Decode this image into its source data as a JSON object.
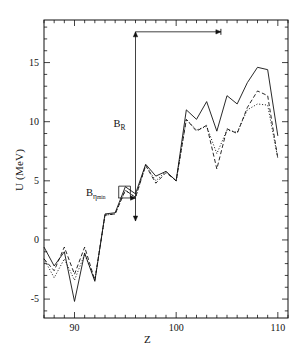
{
  "figure": {
    "kind": "scientific-line-plot",
    "background": "#ffffff",
    "frame_color": "#000000"
  },
  "axes": {
    "xlabel": "Z",
    "ylabel": "U (MeV)",
    "x_tick_labels": [
      "90",
      "100",
      "110"
    ],
    "x_tick_values": [
      90,
      100,
      110
    ],
    "y_tick_labels": [
      "-5",
      "0",
      "5",
      "10",
      "15"
    ],
    "y_tick_values": [
      -5,
      0,
      5,
      10,
      15
    ],
    "xlim": [
      87,
      111
    ],
    "ylim": [
      -6.6,
      18.6
    ],
    "x_minor_step": 1,
    "y_minor_step": 1,
    "grid": false
  },
  "annotations": [
    {
      "name": "b-r-label",
      "text_main": "B",
      "text_sub": "R",
      "x": 96.0,
      "y": 9.7
    },
    {
      "name": "b-eta-label",
      "text_main": "B",
      "text_sub": "η",
      "text_subsub": "min",
      "x": 93.3,
      "y": 3.9
    },
    {
      "name": "vertical-arrow-b-r",
      "type": "double-arrow-vertical",
      "x": 96.0,
      "y_start": 1.6,
      "y_end": 17.6
    },
    {
      "name": "horizontal-arrow-top",
      "type": "arrow-horizontal",
      "y": 17.6,
      "x_start": 96.0,
      "x_end": 104.4
    },
    {
      "name": "horizontal-arrow-b-eta",
      "type": "double-arrow-horizontal",
      "y": 3.55,
      "x_start": 94.3,
      "x_end": 96.0
    },
    {
      "name": "bracket-b-eta",
      "type": "vertical-bracket",
      "x_start": 94.35,
      "x_end": 95.5,
      "y_top": 4.55,
      "y_bottom": 3.55
    }
  ],
  "chart_data": {
    "type": "line",
    "title": "",
    "xlabel": "Z",
    "ylabel": "U (MeV)",
    "xlim": [
      87,
      111
    ],
    "ylim": [
      -6.6,
      18.6
    ],
    "grid": false,
    "legend": "none",
    "x": [
      87,
      88,
      89,
      90,
      91,
      92,
      93,
      94,
      95,
      96,
      97,
      98,
      99,
      100,
      101,
      102,
      103,
      104,
      105,
      106,
      107,
      108,
      109,
      110
    ],
    "series": [
      {
        "name": "solid-curve",
        "style": "solid",
        "color": "#111111",
        "values": [
          -0.6,
          -2.2,
          -1.0,
          -5.2,
          -1.1,
          -3.5,
          2.2,
          2.3,
          4.5,
          3.9,
          6.4,
          5.4,
          5.8,
          5.0,
          11.0,
          10.2,
          11.7,
          9.2,
          12.2,
          11.5,
          13.3,
          14.6,
          14.4,
          8.8
        ]
      },
      {
        "name": "dashed-curve",
        "style": "dashed",
        "color": "#111111",
        "values": [
          -1.6,
          -2.6,
          -0.6,
          -2.9,
          -0.6,
          -3.4,
          2.1,
          2.2,
          4.2,
          3.6,
          6.3,
          4.8,
          5.7,
          5.0,
          10.2,
          9.2,
          9.7,
          6.0,
          9.4,
          9.0,
          11.2,
          12.6,
          12.2,
          6.9
        ]
      },
      {
        "name": "dotted-curve",
        "style": "dotted",
        "color": "#111111",
        "values": [
          -1.6,
          -3.2,
          -1.6,
          -3.4,
          -1.2,
          -3.4,
          2.1,
          2.2,
          4.2,
          3.6,
          6.3,
          5.0,
          5.8,
          5.0,
          10.2,
          9.3,
          9.6,
          7.3,
          9.3,
          9.1,
          11.0,
          11.5,
          11.4,
          6.9
        ]
      }
    ]
  }
}
